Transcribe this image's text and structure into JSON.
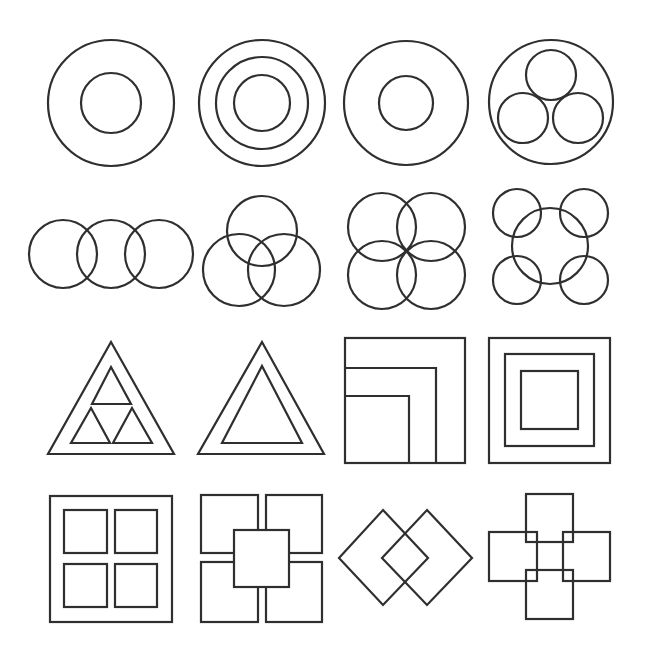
{
  "figure": {
    "stroke_color": "#2f2f2f",
    "background": "#ffffff",
    "top_caption": ""
  },
  "rows": [
    {
      "name": "circles",
      "items": [
        {
          "id": "ring-with-inner-circle",
          "circles": [
            [
              111,
              103,
              63
            ],
            [
              111,
              103,
              30
            ]
          ]
        },
        {
          "id": "three-concentric-circles",
          "circles": [
            [
              262,
              103,
              63
            ],
            [
              262,
              103,
              46
            ],
            [
              262,
              103,
              28
            ]
          ]
        },
        {
          "id": "ring-with-small-inner-circle",
          "circles": [
            [
              406,
              103,
              62
            ],
            [
              406,
              103,
              27
            ]
          ]
        },
        {
          "id": "circle-with-three-inner-circles",
          "circles": [
            [
              551,
              102,
              62
            ],
            [
              551,
              75,
              25
            ],
            [
              523,
              118,
              25
            ],
            [
              578,
              118,
              25
            ]
          ]
        }
      ]
    },
    {
      "name": "overlapping-circles",
      "items": [
        {
          "id": "three-circles-in-row",
          "circles": [
            [
              63,
              254,
              34
            ],
            [
              111,
              254,
              34
            ],
            [
              159,
              254,
              34
            ]
          ]
        },
        {
          "id": "three-circles-venn",
          "circles": [
            [
              262,
              231,
              35
            ],
            [
              239,
              270,
              36
            ],
            [
              284,
              270,
              36
            ]
          ]
        },
        {
          "id": "four-overlapping-circles",
          "circles": [
            [
              382,
              227,
              34
            ],
            [
              431,
              227,
              34
            ],
            [
              382,
              275,
              34
            ],
            [
              431,
              275,
              34
            ]
          ]
        },
        {
          "id": "central-circle-four-corners",
          "circles": [
            [
              550,
              246,
              38
            ],
            [
              517,
              213,
              24
            ],
            [
              584,
              213,
              24
            ],
            [
              517,
              280,
              24
            ],
            [
              584,
              280,
              24
            ]
          ]
        }
      ]
    },
    {
      "name": "triangles-and-squares",
      "items": [
        {
          "id": "triangle-with-three-inner-triangles",
          "polygons": [
            [
              [
                111,
                342
              ],
              [
                174,
                454
              ],
              [
                48,
                454
              ]
            ],
            [
              [
                111,
                367
              ],
              [
                131,
                404
              ],
              [
                92,
                404
              ]
            ],
            [
              [
                91,
                408
              ],
              [
                110,
                443
              ],
              [
                71,
                443
              ]
            ],
            [
              [
                132,
                408
              ],
              [
                152,
                443
              ],
              [
                113,
                443
              ]
            ]
          ]
        },
        {
          "id": "triangle-with-inner-triangle",
          "polygons": [
            [
              [
                262,
                342
              ],
              [
                324,
                454
              ],
              [
                198,
                454
              ]
            ],
            [
              [
                262,
                366
              ],
              [
                302,
                443
              ],
              [
                222,
                443
              ]
            ]
          ]
        },
        {
          "id": "square-with-corner-nested-squares",
          "rects": [
            [
              345,
              338,
              120,
              125
            ]
          ],
          "polylines": [
            [
              [
                345,
                368
              ],
              [
                436,
                368
              ],
              [
                436,
                463
              ]
            ],
            [
              [
                345,
                396
              ],
              [
                409,
                396
              ],
              [
                409,
                463
              ]
            ]
          ]
        },
        {
          "id": "three-concentric-squares",
          "rects": [
            [
              489,
              338,
              121,
              125
            ],
            [
              505,
              354,
              89,
              92
            ],
            [
              521,
              371,
              57,
              58
            ]
          ]
        }
      ]
    },
    {
      "name": "square-compositions",
      "items": [
        {
          "id": "window-four-panes",
          "rects": [
            [
              50,
              496,
              122,
              126
            ],
            [
              64,
              510,
              43,
              43
            ],
            [
              115,
              510,
              42,
              43
            ],
            [
              64,
              564,
              43,
              43
            ],
            [
              115,
              564,
              42,
              43
            ]
          ]
        },
        {
          "id": "four-squares-with-center-square",
          "rects": [
            [
              201,
              495,
              57,
              58
            ],
            [
              266,
              495,
              56,
              58
            ],
            [
              201,
              562,
              57,
              60
            ],
            [
              266,
              562,
              56,
              60
            ]
          ],
          "top_rects": [
            [
              234,
              530,
              55,
              57
            ]
          ]
        },
        {
          "id": "two-overlapping-diamonds",
          "polygons": [
            [
              [
                383,
                510
              ],
              [
                428,
                558
              ],
              [
                383,
                605
              ],
              [
                339,
                558
              ]
            ],
            [
              [
                427,
                510
              ],
              [
                472,
                558
              ],
              [
                427,
                605
              ],
              [
                382,
                558
              ]
            ]
          ]
        },
        {
          "id": "four-squares-cross",
          "rects": [
            [
              526,
              494,
              47,
              48
            ],
            [
              489,
              532,
              48,
              49
            ],
            [
              563,
              532,
              47,
              49
            ],
            [
              526,
              570,
              47,
              49
            ]
          ]
        }
      ]
    }
  ]
}
